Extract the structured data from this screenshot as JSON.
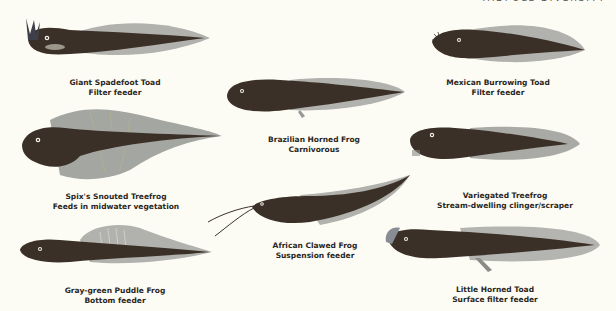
{
  "header": {
    "cut_off_text": "Tadpole Diversity"
  },
  "colors": {
    "background": "#fdfcf4",
    "body": "#3b3027",
    "fin": "#a9a9a5",
    "fin_light": "#c9c9c5",
    "eye": "#f3f1e8",
    "label": "#2a2622"
  },
  "specimens": [
    {
      "id": "giant-spadefoot-toad",
      "name": "Giant Spadefoot Toad",
      "feeding": "Filter feeder"
    },
    {
      "id": "mexican-burrowing-toad",
      "name": "Mexican Burrowing Toad",
      "feeding": "Filter feeder"
    },
    {
      "id": "brazilian-horned-frog",
      "name": "Brazilian Horned Frog",
      "feeding": "Carnivorous"
    },
    {
      "id": "spixs-snouted-treefrog",
      "name": "Spix's Snouted Treefrog",
      "feeding": "Feeds in midwater vegetation"
    },
    {
      "id": "variegated-treefrog",
      "name": "Variegated Treefrog",
      "feeding": "Stream-dwelling clinger/scraper"
    },
    {
      "id": "african-clawed-frog",
      "name": "African Clawed Frog",
      "feeding": "Suspension feeder"
    },
    {
      "id": "gray-green-puddle-frog",
      "name": "Gray-green Puddle Frog",
      "feeding": "Bottom feeder"
    },
    {
      "id": "little-horned-toad",
      "name": "Little Horned Toad",
      "feeding": "Surface filter feeder"
    }
  ]
}
